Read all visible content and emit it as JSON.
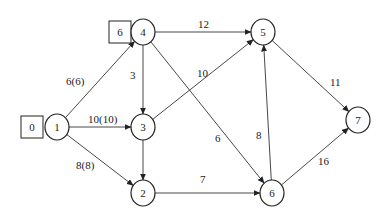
{
  "diagram": {
    "type": "network-flow-graph",
    "nodes": [
      {
        "id": "1",
        "label": "1",
        "x": 57,
        "y": 127
      },
      {
        "id": "2",
        "label": "2",
        "x": 143,
        "y": 193
      },
      {
        "id": "3",
        "label": "3",
        "x": 143,
        "y": 127
      },
      {
        "id": "4",
        "label": "4",
        "x": 143,
        "y": 32
      },
      {
        "id": "5",
        "label": "5",
        "x": 263,
        "y": 32
      },
      {
        "id": "6",
        "label": "6",
        "x": 272,
        "y": 193
      },
      {
        "id": "7",
        "label": "7",
        "x": 358,
        "y": 120
      }
    ],
    "boxes": [
      {
        "attached_to": "1",
        "label": "0",
        "x": 32,
        "y": 127
      },
      {
        "attached_to": "4",
        "label": "6",
        "x": 120,
        "y": 32
      }
    ],
    "edges": [
      {
        "from": "1",
        "to": "4",
        "label": "6(6)"
      },
      {
        "from": "1",
        "to": "3",
        "label": "10(10)"
      },
      {
        "from": "1",
        "to": "2",
        "label": "8(8)"
      },
      {
        "from": "4",
        "to": "5",
        "label": "12"
      },
      {
        "from": "4",
        "to": "3",
        "label": "3"
      },
      {
        "from": "4",
        "to": "6",
        "label": "6"
      },
      {
        "from": "3",
        "to": "5",
        "label": "10"
      },
      {
        "from": "3",
        "to": "2",
        "label": ""
      },
      {
        "from": "2",
        "to": "6",
        "label": "7"
      },
      {
        "from": "6",
        "to": "5",
        "label": "8"
      },
      {
        "from": "5",
        "to": "7",
        "label": "11"
      },
      {
        "from": "6",
        "to": "7",
        "label": "16"
      }
    ]
  }
}
